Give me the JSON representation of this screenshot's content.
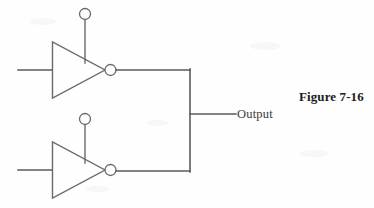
{
  "figure": {
    "caption": "Figure 7-16",
    "output_label": "Output",
    "background_color": "#fefefe",
    "line_color": "#5a5a5a",
    "text_color": "#1c1c1c"
  },
  "diagram": {
    "type": "logic-circuit",
    "gates": [
      {
        "id": "inverter-top",
        "kind": "inverter",
        "triangle": {
          "left": 52,
          "top": 42,
          "tip_x": 105,
          "bottom": 98,
          "mid_y": 70
        },
        "input_wire": {
          "x1": 18,
          "y1": 70,
          "x2": 52,
          "y2": 70
        },
        "output_bubble": {
          "cx": 110.5,
          "cy": 70,
          "r": 5.5
        },
        "output_wire": {
          "x1": 116,
          "y1": 70,
          "x2": 190,
          "y2": 70
        },
        "control_bubble": {
          "cx": 85,
          "cy": 14,
          "r": 5.5
        },
        "control_stem": {
          "x1": 85,
          "y1": 19.5,
          "x2": 85,
          "y2": 63
        }
      },
      {
        "id": "inverter-bottom",
        "kind": "inverter",
        "triangle": {
          "left": 52,
          "top": 142,
          "tip_x": 105,
          "bottom": 198,
          "mid_y": 170
        },
        "input_wire": {
          "x1": 18,
          "y1": 170,
          "x2": 52,
          "y2": 170
        },
        "output_bubble": {
          "cx": 110.5,
          "cy": 170,
          "r": 5.5
        },
        "output_wire": {
          "x1": 116,
          "y1": 171,
          "x2": 190,
          "y2": 171
        },
        "control_bubble": {
          "cx": 85,
          "cy": 119,
          "r": 5.5
        },
        "control_stem": {
          "x1": 85,
          "y1": 124.5,
          "x2": 85,
          "y2": 163
        }
      }
    ],
    "bus": {
      "id": "output-bus",
      "x": 190,
      "y_top": 70,
      "y_bottom": 171
    },
    "output_tap": {
      "x1": 190,
      "y1": 114,
      "x2": 236,
      "y2": 114
    }
  }
}
